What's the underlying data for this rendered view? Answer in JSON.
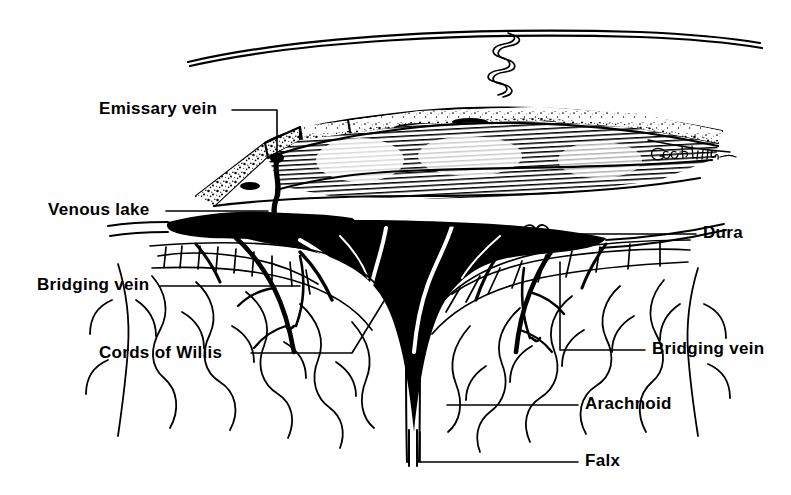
{
  "figure": {
    "kind": "anatomical-illustration",
    "signature": "Goodman",
    "background_color": "#ffffff",
    "ink_color": "#000000"
  },
  "labels": [
    {
      "id": "emissary-vein",
      "text": "Emissary vein",
      "side": "left",
      "x": 99,
      "y": 100,
      "leader": "M232,110 L277,110 L277,157"
    },
    {
      "id": "venous-lake",
      "text": "Venous lake",
      "side": "left",
      "x": 48,
      "y": 201,
      "leader": "M166,211 L268,211"
    },
    {
      "id": "bridging-vein-left",
      "text": "Bridging vein",
      "side": "left",
      "x": 37,
      "y": 276,
      "leader": "M160,286 L300,286"
    },
    {
      "id": "cords-of-willis",
      "text": "Cords of Willis",
      "side": "left",
      "x": 99,
      "y": 344,
      "leader": "M251,353 L352,353 L392,288"
    },
    {
      "id": "dura",
      "text": "Dura",
      "side": "right",
      "x": 703,
      "y": 224,
      "leader": "M696,234 L560,234"
    },
    {
      "id": "bridging-vein-right",
      "text": "Bridging vein",
      "side": "right",
      "x": 652,
      "y": 340,
      "leader": "M645,350 L560,350 L560,262"
    },
    {
      "id": "arachnoid",
      "text": "Arachnoid",
      "side": "right",
      "x": 585,
      "y": 395,
      "leader": "M578,405 L447,405"
    },
    {
      "id": "falx",
      "text": "Falx",
      "side": "right",
      "x": 585,
      "y": 452,
      "leader": "M578,462 L420,462 L420,432"
    }
  ],
  "structures": [
    {
      "id": "scalp",
      "name": "Scalp outer surface"
    },
    {
      "id": "skull-outer-table",
      "name": "Outer table of skull"
    },
    {
      "id": "diploe",
      "name": "Diploe (stippled cancellous bone)"
    },
    {
      "id": "skull-inner-table",
      "name": "Inner table of skull (hatched cutaway)"
    },
    {
      "id": "emissary-vein",
      "name": "Emissary vein traversing skull"
    },
    {
      "id": "venous-lake",
      "name": "Venous lake in diploe"
    },
    {
      "id": "dura-mater",
      "name": "Dura mater"
    },
    {
      "id": "sagittal-sinus",
      "name": "Superior sagittal sinus (black lumen)"
    },
    {
      "id": "cords-of-willis",
      "name": "Cords of Willis within sinus"
    },
    {
      "id": "arachnoid-granulations",
      "name": "Arachnoid granulations / trabeculae"
    },
    {
      "id": "falx-cerebri",
      "name": "Falx cerebri"
    },
    {
      "id": "bridging-veins",
      "name": "Bridging veins entering sinus"
    },
    {
      "id": "cerebral-cortex",
      "name": "Cerebral cortex gyri and sulci"
    }
  ]
}
